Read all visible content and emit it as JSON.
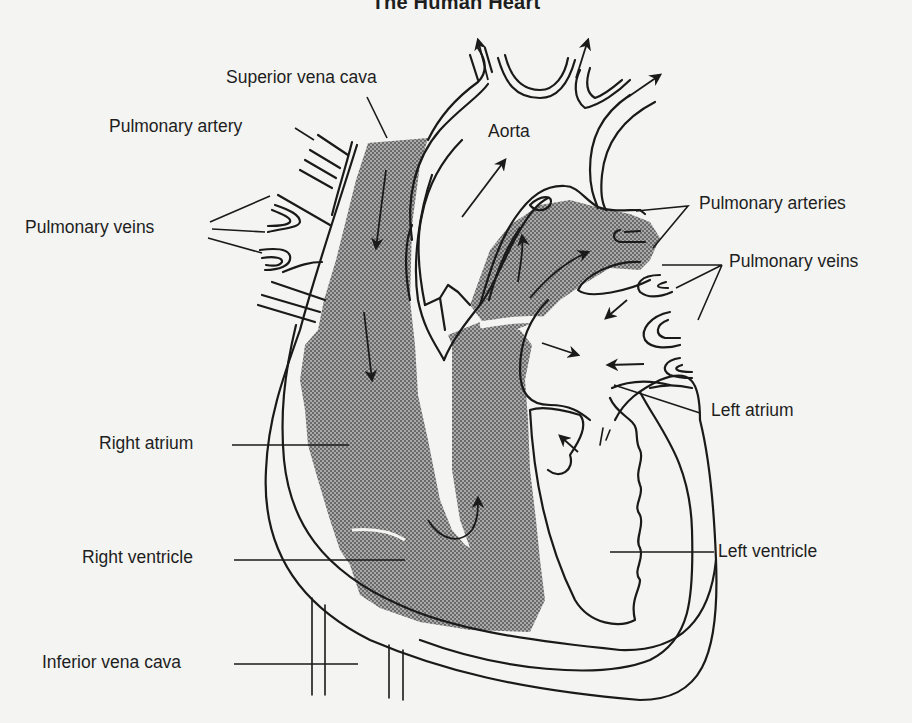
{
  "title": "The Human Heart",
  "colors": {
    "background": "#f4f4f2",
    "line": "#1a1a1a",
    "stipple_dark": "#6d6d6d",
    "stipple_light": "#b8b8b8"
  },
  "legend_note": "Stippled region = deoxygenated blood (right heart and pulmonary trunk)",
  "labels": {
    "superior_vena_cava": "Superior vena cava",
    "pulmonary_artery": "Pulmonary artery",
    "pulmonary_veins_left": "Pulmonary veins",
    "aorta": "Aorta",
    "pulmonary_arteries": "Pulmonary arteries",
    "pulmonary_veins_right": "Pulmonary veins",
    "left_atrium": "Left atrium",
    "right_atrium": "Right atrium",
    "right_ventricle": "Right ventricle",
    "left_ventricle": "Left ventricle",
    "inferior_vena_cava": "Inferior vena cava"
  },
  "flow_arrows": [
    {
      "name": "svc-inflow-arrow",
      "direction": "down"
    },
    {
      "name": "right-atrium-arrow",
      "direction": "down"
    },
    {
      "name": "tricuspid-curve-arrow",
      "direction": "up"
    },
    {
      "name": "pulmonary-trunk-arrow-1",
      "direction": "up"
    },
    {
      "name": "pulmonary-trunk-arrow-2",
      "direction": "up-right"
    },
    {
      "name": "aorta-outflow-arrow",
      "direction": "up-right"
    },
    {
      "name": "aortic-branch-arrow-1",
      "direction": "up"
    },
    {
      "name": "aortic-branch-arrow-2",
      "direction": "up"
    },
    {
      "name": "aortic-branch-arrow-3",
      "direction": "up-right"
    },
    {
      "name": "pulmonary-vein-arrow-1",
      "direction": "down-left"
    },
    {
      "name": "pulmonary-vein-arrow-2",
      "direction": "left"
    },
    {
      "name": "pulmonary-vein-arrow-3",
      "direction": "right"
    },
    {
      "name": "mitral-arrow",
      "direction": "up-left"
    }
  ]
}
